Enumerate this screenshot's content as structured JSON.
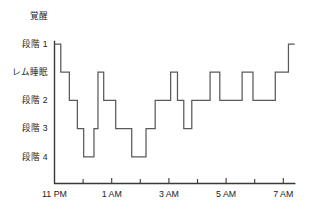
{
  "chart_data": {
    "type": "line",
    "title": "",
    "xlabel": "",
    "ylabel": "",
    "style": "hypnogram step plot",
    "line_color": "#5a5a5a",
    "axis_color": "#3a3a3a",
    "grid": false,
    "legend": null,
    "y_categories": [
      {
        "key": "awake",
        "label": "覚醒"
      },
      {
        "key": "stage1",
        "label": "段階 1"
      },
      {
        "key": "rem",
        "label": "レム睡眠"
      },
      {
        "key": "stage2",
        "label": "段階 2"
      },
      {
        "key": "stage3",
        "label": "段階 3"
      },
      {
        "key": "stage4",
        "label": "段階 4"
      }
    ],
    "y_order": [
      "awake",
      "stage1",
      "rem",
      "stage2",
      "stage3",
      "stage4"
    ],
    "ylim_levels": [
      0,
      5
    ],
    "x_tick_labels": [
      "11 PM",
      "1 AM",
      "3 AM",
      "5 AM",
      "7 AM"
    ],
    "x_major_ticks_hours": [
      0,
      2,
      4,
      6,
      8
    ],
    "x_minor_ticks_hours": [
      1,
      3,
      5,
      7
    ],
    "xlim_hours": [
      0,
      8.4
    ],
    "x_unit": "hours after 11 PM",
    "steps": [
      {
        "t": 0.0,
        "stage": "stage1"
      },
      {
        "t": 0.22,
        "stage": "rem"
      },
      {
        "t": 0.52,
        "stage": "stage2"
      },
      {
        "t": 0.8,
        "stage": "stage3"
      },
      {
        "t": 1.02,
        "stage": "stage4"
      },
      {
        "t": 1.38,
        "stage": "stage3"
      },
      {
        "t": 1.52,
        "stage": "rem"
      },
      {
        "t": 1.72,
        "stage": "stage2"
      },
      {
        "t": 2.14,
        "stage": "stage3"
      },
      {
        "t": 2.7,
        "stage": "stage4"
      },
      {
        "t": 3.2,
        "stage": "stage3"
      },
      {
        "t": 3.52,
        "stage": "stage2"
      },
      {
        "t": 4.06,
        "stage": "rem"
      },
      {
        "t": 4.3,
        "stage": "stage2"
      },
      {
        "t": 4.52,
        "stage": "stage3"
      },
      {
        "t": 4.8,
        "stage": "stage2"
      },
      {
        "t": 5.44,
        "stage": "rem"
      },
      {
        "t": 5.78,
        "stage": "stage2"
      },
      {
        "t": 6.56,
        "stage": "rem"
      },
      {
        "t": 6.94,
        "stage": "stage2"
      },
      {
        "t": 7.72,
        "stage": "rem"
      },
      {
        "t": 8.18,
        "stage": "stage1"
      },
      {
        "t": 8.4,
        "stage": "stage1"
      }
    ]
  }
}
